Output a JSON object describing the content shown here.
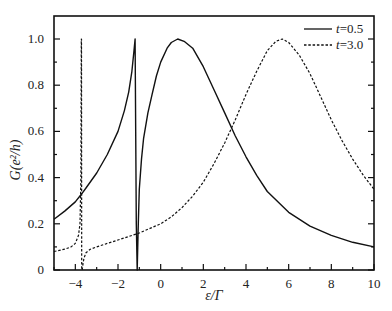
{
  "chart_data": {
    "type": "line",
    "title": "",
    "xlabel": "ε/Γ",
    "ylabel": "G(e²/h)",
    "xlim": [
      -5,
      10
    ],
    "ylim": [
      0,
      1.1
    ],
    "xticks": [
      -4,
      -2,
      0,
      2,
      4,
      6,
      8,
      10
    ],
    "xtick_labels": [
      "−4",
      "−2",
      "0",
      "2",
      "4",
      "6",
      "8",
      "10"
    ],
    "yticks": [
      0,
      0.2,
      0.4,
      0.6,
      0.8,
      1.0
    ],
    "ytick_labels": [
      "0",
      "0.2",
      "0.4",
      "0.6",
      "0.8",
      "1.0"
    ],
    "grid": false,
    "legend_position": "upper right",
    "series": [
      {
        "name": "t=0.5",
        "legend_var": "t",
        "legend_value": "=0.5",
        "style": "solid",
        "x": [
          -5,
          -4.5,
          -4,
          -3.7,
          -3.5,
          -3,
          -2.5,
          -2,
          -1.7,
          -1.5,
          -1.35,
          -1.25,
          -1.2,
          -1.17,
          -1.14,
          -1.1,
          -1.05,
          -1.0,
          -0.9,
          -0.8,
          -0.6,
          -0.4,
          -0.2,
          0,
          0.3,
          0.5,
          0.8,
          1.1,
          1.5,
          2,
          2.5,
          3,
          3.5,
          4,
          4.5,
          5,
          6,
          7,
          8,
          9,
          10
        ],
        "y": [
          0.22,
          0.255,
          0.295,
          0.33,
          0.355,
          0.42,
          0.5,
          0.6,
          0.69,
          0.77,
          0.86,
          0.95,
          1.0,
          0.6,
          0.2,
          0.0,
          0.2,
          0.35,
          0.48,
          0.57,
          0.68,
          0.76,
          0.84,
          0.9,
          0.96,
          0.985,
          1.0,
          0.99,
          0.96,
          0.88,
          0.78,
          0.68,
          0.58,
          0.49,
          0.41,
          0.34,
          0.25,
          0.19,
          0.15,
          0.12,
          0.1
        ]
      },
      {
        "name": "t=3.0",
        "legend_var": "t",
        "legend_value": "=3.0",
        "style": "dashed",
        "x": [
          -5,
          -4.5,
          -4.2,
          -4.0,
          -3.85,
          -3.78,
          -3.74,
          -3.72,
          -3.71,
          -3.7,
          -3.68,
          -3.65,
          -3.6,
          -3.5,
          -3.3,
          -3,
          -2.5,
          -2,
          -1.5,
          -1,
          -0.5,
          0,
          0.5,
          1,
          1.5,
          2,
          2.5,
          3,
          3.5,
          4,
          4.5,
          5,
          5.4,
          5.7,
          6,
          6.5,
          7,
          7.5,
          8,
          8.5,
          9,
          9.5,
          10
        ],
        "y": [
          0.08,
          0.09,
          0.1,
          0.115,
          0.15,
          0.2,
          0.4,
          1.0,
          1.0,
          0.0,
          0.0,
          0.02,
          0.05,
          0.075,
          0.09,
          0.1,
          0.115,
          0.13,
          0.145,
          0.16,
          0.18,
          0.2,
          0.23,
          0.27,
          0.32,
          0.38,
          0.46,
          0.55,
          0.65,
          0.76,
          0.86,
          0.95,
          0.99,
          1.0,
          0.985,
          0.93,
          0.85,
          0.75,
          0.65,
          0.56,
          0.48,
          0.41,
          0.35
        ]
      }
    ]
  }
}
